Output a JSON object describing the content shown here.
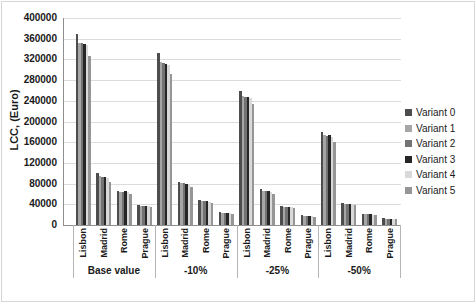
{
  "chart_data": {
    "type": "bar",
    "title": "",
    "ylabel": "LCC, (Euro)",
    "xlabel": "",
    "ylim": [
      0,
      400000
    ],
    "ytick_step": 40000,
    "y_tick_labels": [
      "0",
      "40000",
      "80000",
      "120000",
      "160000",
      "200000",
      "240000",
      "280000",
      "320000",
      "360000",
      "400000"
    ],
    "grid": true,
    "legend_position": "right",
    "groups": [
      "Base value",
      "-10%",
      "-25%",
      "-50%"
    ],
    "cities": [
      "Lisbon",
      "Madrid",
      "Rome",
      "Prague"
    ],
    "series": [
      {
        "name": "Variant 0",
        "color": "#4d4d4d",
        "values": [
          [
            370000,
            100000,
            66000,
            38000
          ],
          [
            332000,
            84000,
            48000,
            25000
          ],
          [
            259000,
            69000,
            36000,
            19000
          ],
          [
            180000,
            42000,
            22000,
            13000
          ]
        ]
      },
      {
        "name": "Variant 1",
        "color": "#a6a6a6",
        "values": [
          [
            352000,
            95000,
            64000,
            36000
          ],
          [
            315000,
            82000,
            47000,
            24000
          ],
          [
            250000,
            66000,
            35000,
            18000
          ],
          [
            173000,
            41000,
            21000,
            12000
          ]
        ]
      },
      {
        "name": "Variant 2",
        "color": "#737373",
        "values": [
          [
            351000,
            93000,
            64000,
            36000
          ],
          [
            313000,
            81000,
            46000,
            24000
          ],
          [
            248000,
            65000,
            35000,
            18000
          ],
          [
            172000,
            41000,
            21000,
            12000
          ]
        ]
      },
      {
        "name": "Variant 3",
        "color": "#262626",
        "values": [
          [
            350000,
            93000,
            65000,
            37000
          ],
          [
            312000,
            80000,
            47000,
            24000
          ],
          [
            247000,
            65000,
            35000,
            18000
          ],
          [
            173000,
            41000,
            21000,
            12000
          ]
        ]
      },
      {
        "name": "Variant 4",
        "color": "#d9d9d9",
        "values": [
          [
            347000,
            91000,
            63000,
            36000
          ],
          [
            309000,
            79000,
            45000,
            23000
          ],
          [
            245000,
            64000,
            34000,
            17000
          ],
          [
            170000,
            40000,
            20000,
            12000
          ]
        ]
      },
      {
        "name": "Variant 5",
        "color": "#969696",
        "values": [
          [
            326000,
            84000,
            60000,
            34000
          ],
          [
            291000,
            73000,
            43000,
            22000
          ],
          [
            233000,
            60000,
            32000,
            16000
          ],
          [
            161000,
            38000,
            19000,
            11000
          ]
        ]
      }
    ]
  }
}
